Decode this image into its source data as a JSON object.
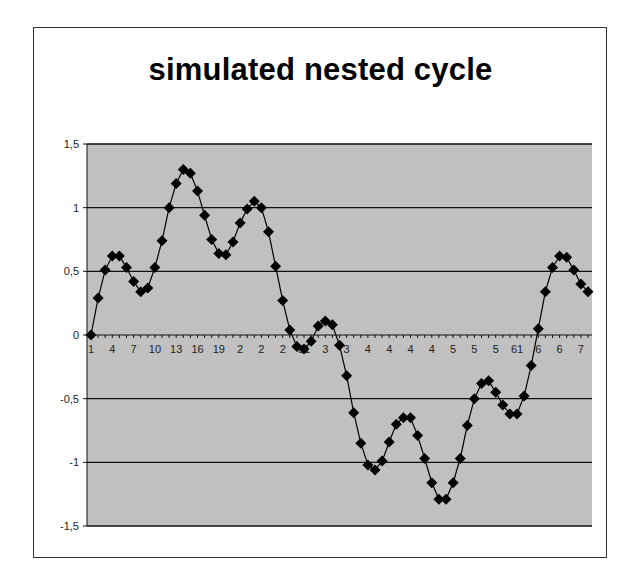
{
  "chart_data": {
    "type": "line",
    "title": "simulated nested cycle",
    "xlabel": "",
    "ylabel": "",
    "ylim": [
      -1.5,
      1.5
    ],
    "yticks": [
      1.5,
      1,
      0.5,
      0,
      -0.5,
      -1,
      -1.5
    ],
    "ytick_labels": [
      "1,5",
      "1",
      "0,5",
      "0",
      "-0,5",
      "-1",
      "-1,5"
    ],
    "x_tick_labels": [
      "1",
      "4",
      "7",
      "10",
      "13",
      "16",
      "19",
      "2",
      "2",
      "2",
      "31",
      "3",
      "3",
      "4",
      "4",
      "4",
      "4",
      "5",
      "5",
      "5",
      "61",
      "6",
      "6",
      "7"
    ],
    "x_tick_every": 3,
    "grid": true,
    "legend": "none",
    "plot_background": "#c0c0c0",
    "marker": "diamond",
    "line_color": "#000000",
    "x": [
      1,
      2,
      3,
      4,
      5,
      6,
      7,
      8,
      9,
      10,
      11,
      12,
      13,
      14,
      15,
      16,
      17,
      18,
      19,
      20,
      21,
      22,
      23,
      24,
      25,
      26,
      27,
      28,
      29,
      30,
      31,
      32,
      33,
      34,
      35,
      36,
      37,
      38,
      39,
      40,
      41,
      42,
      43,
      44,
      45,
      46,
      47,
      48,
      49,
      50,
      51,
      52,
      53,
      54,
      55,
      56,
      57,
      58,
      59,
      60,
      61,
      62,
      63,
      64,
      65,
      66,
      67,
      68,
      69,
      70,
      71
    ],
    "series": [
      {
        "name": "simulated nested cycle",
        "values": [
          0,
          0.29,
          0.51,
          0.62,
          0.62,
          0.53,
          0.42,
          0.34,
          0.37,
          0.53,
          0.74,
          1.0,
          1.19,
          1.3,
          1.27,
          1.13,
          0.94,
          0.75,
          0.64,
          0.63,
          0.73,
          0.88,
          0.99,
          1.05,
          1.0,
          0.81,
          0.54,
          0.27,
          0.04,
          -0.09,
          -0.11,
          -0.05,
          0.07,
          0.11,
          0.08,
          -0.08,
          -0.32,
          -0.61,
          -0.85,
          -1.02,
          -1.06,
          -0.99,
          -0.84,
          -0.7,
          -0.65,
          -0.65,
          -0.79,
          -0.97,
          -1.16,
          -1.29,
          -1.29,
          -1.16,
          -0.97,
          -0.71,
          -0.5,
          -0.38,
          -0.36,
          -0.45,
          -0.55,
          -0.62,
          -0.62,
          -0.48,
          -0.24,
          0.05,
          0.34,
          0.53,
          0.62,
          0.61,
          0.51,
          0.4,
          0.34
        ]
      }
    ]
  }
}
